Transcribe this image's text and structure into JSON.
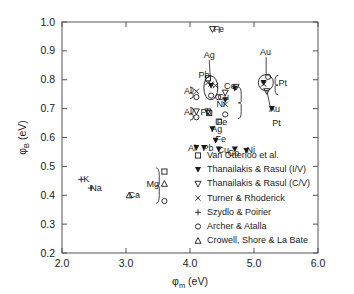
{
  "chart_data": {
    "type": "scatter",
    "title": "",
    "xlabel": "φm (eV)",
    "xlabel_main": "φ",
    "xlabel_sub": "m",
    "xlabel_unit": " (eV)",
    "ylabel": "φB (eV)",
    "ylabel_main": "φ",
    "ylabel_sub": "B",
    "ylabel_unit": " (eV)",
    "xlim": [
      2.0,
      6.0
    ],
    "ylim": [
      0.2,
      1.0
    ],
    "xticks": [
      "2.0",
      "3.0",
      "4.0",
      "5.0",
      "6.0"
    ],
    "xtick_values": [
      2.0,
      3.0,
      4.0,
      5.0,
      6.0
    ],
    "yticks": [
      "0.2",
      "0.3",
      "0.4",
      "0.5",
      "0.6",
      "0.7",
      "0.8",
      "0.9",
      "1.0"
    ],
    "ytick_values": [
      0.2,
      0.3,
      0.4,
      0.5,
      0.6,
      0.7,
      0.8,
      0.9,
      1.0
    ],
    "grid": false,
    "legend_position": "bottom-right",
    "series": [
      {
        "name": "Van Otterloo et al.",
        "marker": "open-square",
        "points": [
          {
            "x": 4.28,
            "y": 0.805,
            "label": "Pb"
          },
          {
            "x": 4.3,
            "y": 0.685,
            "label": "Pb"
          },
          {
            "x": 4.45,
            "y": 0.655,
            "label": "Fe"
          },
          {
            "x": 3.6,
            "y": 0.482,
            "label": "Mg"
          }
        ]
      },
      {
        "name": "Thanailakis & Rasul (I/V)",
        "marker": "filled-triangle-down",
        "points": [
          {
            "x": 4.33,
            "y": 0.78,
            "label": "Ag"
          },
          {
            "x": 5.15,
            "y": 0.79,
            "label": "Au"
          },
          {
            "x": 4.7,
            "y": 0.77,
            "label": "Co"
          },
          {
            "x": 4.55,
            "y": 0.73,
            "label": "Ni"
          },
          {
            "x": 5.28,
            "y": 0.7,
            "label": "Pt"
          },
          {
            "x": 4.35,
            "y": 0.63,
            "label": "Ag"
          },
          {
            "x": 4.4,
            "y": 0.59,
            "label": "Fe"
          },
          {
            "x": 4.22,
            "y": 0.565,
            "label": "Pb"
          },
          {
            "x": 4.1,
            "y": 0.565,
            "label": "Al"
          },
          {
            "x": 4.45,
            "y": 0.56,
            "label": "Cu"
          },
          {
            "x": 4.7,
            "y": 0.56,
            "label": "Co"
          },
          {
            "x": 4.88,
            "y": 0.555,
            "label": "Ni"
          }
        ]
      },
      {
        "name": "Thanailakis & Rasul (C/V)",
        "marker": "open-triangle-down",
        "points": [
          {
            "x": 4.35,
            "y": 0.975,
            "label": "Fe"
          },
          {
            "x": 4.72,
            "y": 0.775,
            "label": "Co"
          },
          {
            "x": 5.2,
            "y": 0.76,
            "label": "Pt"
          },
          {
            "x": 4.1,
            "y": 0.69,
            "label": "Al"
          },
          {
            "x": 4.28,
            "y": 0.69,
            "label": "Pb"
          },
          {
            "x": 4.55,
            "y": 0.755,
            "label": "Ni"
          }
        ]
      },
      {
        "name": "Turner & Rhoderick",
        "marker": "cross-x",
        "points": [
          {
            "x": 4.28,
            "y": 0.79,
            "label": "Pb"
          },
          {
            "x": 4.33,
            "y": 0.785,
            "label": "Ag"
          },
          {
            "x": 4.1,
            "y": 0.76,
            "label": "Al"
          },
          {
            "x": 4.4,
            "y": 0.78,
            "label": "Cu"
          },
          {
            "x": 5.15,
            "y": 0.785,
            "label": "Au"
          },
          {
            "x": 4.55,
            "y": 0.715,
            "label": "Ni"
          }
        ]
      },
      {
        "name": "Szydlo & Poirier",
        "marker": "plus",
        "points": [
          {
            "x": 2.3,
            "y": 0.455,
            "label": "K"
          },
          {
            "x": 2.45,
            "y": 0.425,
            "label": "Na"
          }
        ]
      },
      {
        "name": "Archer & Atalla",
        "marker": "open-circle",
        "points": [
          {
            "x": 4.33,
            "y": 0.745,
            "label": "Ag"
          },
          {
            "x": 4.1,
            "y": 0.74,
            "label": "Al"
          },
          {
            "x": 4.44,
            "y": 0.74,
            "label": "Cu"
          },
          {
            "x": 4.1,
            "y": 0.67,
            "label": "Al"
          },
          {
            "x": 5.22,
            "y": 0.81,
            "label": "Au"
          },
          {
            "x": 4.55,
            "y": 0.68,
            "label": "Ni"
          },
          {
            "x": 3.6,
            "y": 0.38,
            "label": "Mg"
          }
        ]
      },
      {
        "name": "Crowell, Shore & La Bate",
        "marker": "open-triangle-up",
        "points": [
          {
            "x": 3.05,
            "y": 0.4,
            "label": "Ca"
          },
          {
            "x": 3.6,
            "y": 0.44,
            "label": "Mg"
          }
        ]
      }
    ],
    "annotations": [
      {
        "text": "Fe",
        "x": 4.45,
        "y": 0.975
      },
      {
        "text": "Ag",
        "x": 4.3,
        "y": 0.885
      },
      {
        "text": "Au",
        "x": 5.18,
        "y": 0.895
      },
      {
        "text": "Pt",
        "x": 5.45,
        "y": 0.79
      },
      {
        "text": "Co",
        "x": 4.62,
        "y": 0.78
      },
      {
        "text": "Pb",
        "x": 4.22,
        "y": 0.815
      },
      {
        "text": "Al",
        "x": 3.97,
        "y": 0.76
      },
      {
        "text": "Cu",
        "x": 4.52,
        "y": 0.74
      },
      {
        "text": "Pb",
        "x": 4.25,
        "y": 0.69
      },
      {
        "text": "Al",
        "x": 3.97,
        "y": 0.69
      },
      {
        "text": "Fe",
        "x": 4.5,
        "y": 0.655
      },
      {
        "text": "Ni",
        "x": 4.48,
        "y": 0.715
      },
      {
        "text": "Au",
        "x": 5.32,
        "y": 0.7
      },
      {
        "text": "Pt",
        "x": 5.35,
        "y": 0.65
      },
      {
        "text": "Ag",
        "x": 4.42,
        "y": 0.63
      },
      {
        "text": "Fe",
        "x": 4.48,
        "y": 0.595
      },
      {
        "text": "Al",
        "x": 4.03,
        "y": 0.565
      },
      {
        "text": "Pb",
        "x": 4.28,
        "y": 0.565
      },
      {
        "text": "Cu",
        "x": 4.52,
        "y": 0.555
      },
      {
        "text": "Co",
        "x": 4.68,
        "y": 0.548
      },
      {
        "text": "Ni",
        "x": 4.95,
        "y": 0.555
      },
      {
        "text": "Mg",
        "x": 3.42,
        "y": 0.44
      },
      {
        "text": "K",
        "x": 2.38,
        "y": 0.455
      },
      {
        "text": "Na",
        "x": 2.53,
        "y": 0.425
      },
      {
        "text": "Ca",
        "x": 3.13,
        "y": 0.4
      }
    ]
  },
  "legend": {
    "items": [
      {
        "marker": "open-square",
        "label": "Van Otterloo et al."
      },
      {
        "marker": "filled-triangle-down",
        "label": "Thanailakis & Rasul (I/V)"
      },
      {
        "marker": "open-triangle-down",
        "label": "Thanailakis & Rasul (C/V)"
      },
      {
        "marker": "cross-x",
        "label": "Turner & Rhoderick"
      },
      {
        "marker": "plus",
        "label": "Szydlo & Poirier"
      },
      {
        "marker": "open-circle",
        "label": "Archer & Atalla"
      },
      {
        "marker": "open-triangle-up",
        "label": "Crowell, Shore & La Bate"
      }
    ]
  },
  "colors": {
    "axis": "#555555",
    "ink": "#1a1a1a",
    "background": "#ffffff"
  }
}
